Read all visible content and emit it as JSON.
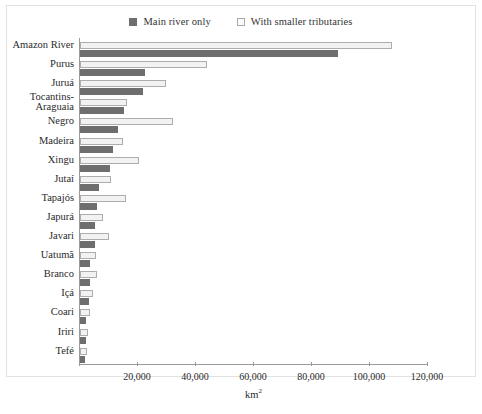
{
  "chart_data": {
    "type": "bar",
    "orientation": "horizontal",
    "title": "",
    "xlabel": "km²",
    "ylabel": "",
    "xlim": [
      0,
      120000
    ],
    "xticks": [
      0,
      20000,
      40000,
      60000,
      80000,
      100000,
      120000
    ],
    "xtick_labels": [
      "",
      "20,000",
      "40,000",
      "60,000",
      "80,000",
      "100,000",
      "120,000"
    ],
    "grid": false,
    "legend_position": "top-center",
    "categories": [
      "Amazon River",
      "Purus",
      "Juruá",
      "Tocantins-\nAraguaia",
      "Negro",
      "Madeira",
      "Xingu",
      "Jutaí",
      "Tapajós",
      "Japurá",
      "Javari",
      "Uatumã",
      "Branco",
      "Içá",
      "Coari",
      "Iriri",
      "Tefé"
    ],
    "series": [
      {
        "name": "Main river only",
        "color": "#6e6e6e",
        "values": [
          88800,
          22400,
          21700,
          15200,
          13200,
          11400,
          10300,
          6600,
          5900,
          5200,
          5200,
          3500,
          3400,
          3100,
          2200,
          1900,
          1700
        ]
      },
      {
        "name": "With smaller tributaries",
        "color": "#f2f2f2",
        "values": [
          107500,
          43800,
          29700,
          16200,
          32000,
          14800,
          20300,
          10700,
          15900,
          8000,
          9900,
          5500,
          5900,
          4500,
          3300,
          2900,
          2500
        ]
      }
    ]
  },
  "legend": {
    "items": [
      {
        "label": "Main river only",
        "swatch": "filled-square-dark"
      },
      {
        "label": "With smaller tributaries",
        "swatch": "open-square-light"
      }
    ]
  },
  "colors": {
    "main_river": "#6e6e6e",
    "tributaries_fill": "#f2f2f2",
    "tributaries_border": "#adadad",
    "axis": "#9a9a9a",
    "frame": "#e2e2e2",
    "text": "#2a2a2a",
    "background": "#ffffff"
  }
}
